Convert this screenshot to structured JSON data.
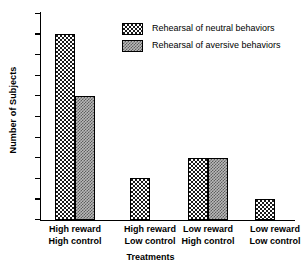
{
  "chart_data": {
    "type": "bar",
    "title": "",
    "xlabel": "Treatments",
    "ylabel": "Number of Subjects",
    "categories": [
      "High reward\nHigh control",
      "High reward\nLow control",
      "Low reward\nHigh control",
      "Low reward\nLow control"
    ],
    "category_lines": [
      [
        "High reward",
        "High control"
      ],
      [
        "High reward",
        "Low control"
      ],
      [
        "Low reward",
        "High control"
      ],
      [
        "Low reward",
        "Low control"
      ]
    ],
    "series": [
      {
        "name": "Rehearsal of neutral behaviors",
        "values": [
          9,
          2,
          3,
          1
        ]
      },
      {
        "name": "Rehearsal of aversive behaviors",
        "values": [
          6,
          0,
          3,
          0
        ]
      }
    ],
    "ylim": [
      0,
      10
    ],
    "ytick_labels": [
      "0",
      "1",
      "2",
      "3",
      "4",
      "5",
      "6",
      "7",
      "8",
      "9",
      "10"
    ],
    "ytick_values": [
      0,
      1,
      2,
      3,
      4,
      5,
      6,
      7,
      8,
      9,
      10
    ],
    "grid": false,
    "legend_position": "upper right",
    "colors": {
      "neutral_fill": "#ffffff",
      "neutral_dots": "#1a1a1a",
      "aversive_fill": "#b9b9b9",
      "aversive_dots": "#5e5e5e",
      "outline": "#000000",
      "axis": "#000000",
      "background": "#ffffff"
    }
  },
  "legend": {
    "entries": [
      {
        "label": "Rehearsal of neutral behaviors",
        "pattern": "neutral"
      },
      {
        "label": "Rehearsal of aversive behaviors",
        "pattern": "aversive"
      }
    ]
  }
}
